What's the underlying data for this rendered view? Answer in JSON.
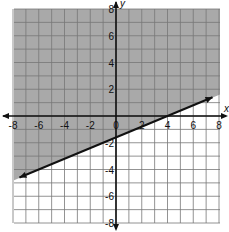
{
  "chart_data": {
    "type": "line",
    "title": "",
    "xlabel": "x",
    "ylabel": "y",
    "xlim": [
      -8,
      8
    ],
    "ylim": [
      -8,
      8
    ],
    "grid": true,
    "x_ticks": [
      "-8",
      "-6",
      "-4",
      "-2",
      "0",
      "2",
      "4",
      "6",
      "8"
    ],
    "y_ticks": [
      "8",
      "6",
      "4",
      "2",
      "-2",
      "-4",
      "-6",
      "-8"
    ],
    "boundary_line": {
      "style": "solid",
      "slope": 0.4,
      "y_intercept": -1.6,
      "x_intercept": 4,
      "start": [
        -7.5,
        -4.6
      ],
      "end": [
        7.5,
        1.4
      ],
      "arrows": "both"
    },
    "shaded_region": "above line",
    "inequality": "y >= 0.4x - 1.6",
    "colors": {
      "shade": "#a9a9a9",
      "grid": "#777777",
      "axis": "#111111",
      "line": "#111111"
    }
  }
}
